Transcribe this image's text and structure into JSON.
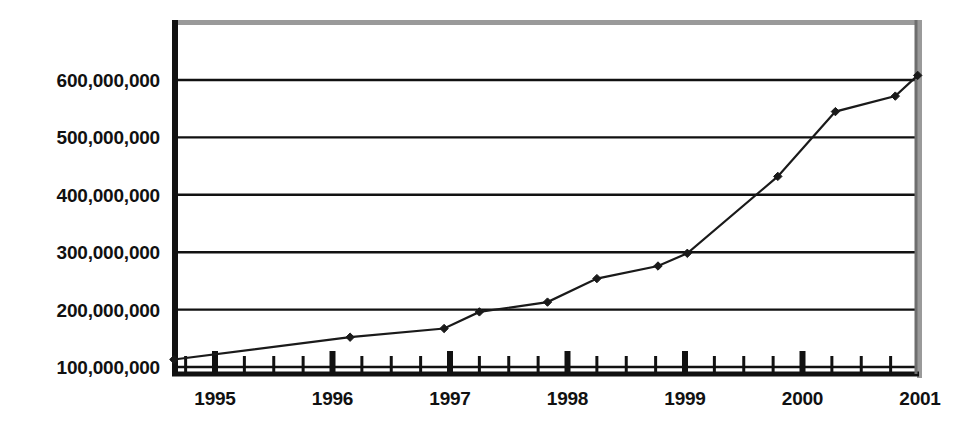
{
  "chart_data": {
    "type": "line",
    "title": "",
    "subtitle": "",
    "xlabel": "",
    "ylabel": "",
    "grid": true,
    "legend": false,
    "legend_position": "none",
    "xlim": [
      1994.6,
      1995.0
    ],
    "ylim": [
      100000000,
      650000000
    ],
    "y_ticks": [
      100000000,
      200000000,
      300000000,
      400000000,
      500000000,
      600000000
    ],
    "y_tick_labels": [
      "100,000,000",
      "200,000,000",
      "300,000,000",
      "400,000,000",
      "500,000,000",
      "600,000,000"
    ],
    "x_tick_labels": [
      "1995",
      "1996",
      "1997",
      "1998",
      "1999",
      "2000",
      "2001"
    ],
    "x_major_ticks": [
      1995,
      1996,
      1997,
      1998,
      1999,
      2000,
      2001
    ],
    "x_minor_ticks_per_year": 4,
    "series": [
      {
        "name": "series-1",
        "marker": "diamond",
        "color": "#1a1a1a",
        "x": [
          1994.65,
          1996.15,
          1996.95,
          1997.25,
          1997.83,
          1998.25,
          1998.77,
          1999.02,
          1999.79,
          2000.28,
          2000.79,
          2000.98
        ],
        "values": [
          113000000,
          152000000,
          167000000,
          196000000,
          213000000,
          254000000,
          276000000,
          298000000,
          432000000,
          545000000,
          572000000,
          608000000
        ]
      }
    ],
    "colors": {
      "line": "#1a1a1a",
      "marker": "#1a1a1a",
      "grid": "#111111",
      "axis": "#111111",
      "plot_background": "#ffffff",
      "page_background": "#ffffff",
      "frame_shadow": "#9a9a9a"
    },
    "geometry": {
      "plot_left": 172,
      "plot_right": 917,
      "plot_top": 20,
      "plot_bottom": 375,
      "y_value_top": 100000000,
      "y_pixel_for_100m": 367,
      "pixels_per_100m": 57.4,
      "year_pixel_1995": 215,
      "pixels_per_year": 117.5
    }
  }
}
